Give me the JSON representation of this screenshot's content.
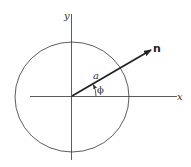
{
  "diagram": {
    "axes": {
      "x_label": "x",
      "y_label": "y"
    },
    "circle": {
      "description": "circle centered at origin"
    },
    "vector": {
      "label": "n",
      "length_label": "a"
    },
    "angle": {
      "label": "ϕ"
    },
    "colors": {
      "stroke": "#333333",
      "background": "#ffffff"
    }
  }
}
